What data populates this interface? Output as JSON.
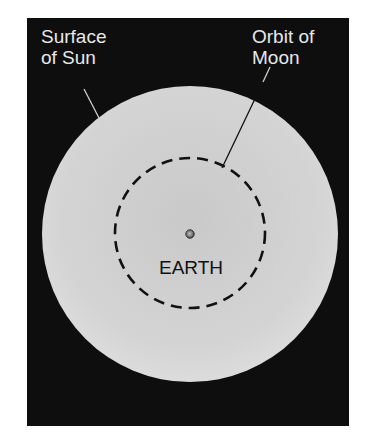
{
  "diagram": {
    "background_color": "#0e0e0e",
    "sun": {
      "label_line1": "Surface",
      "label_line2": "of Sun",
      "color": "#d2d2d2"
    },
    "orbit": {
      "label_line1": "Orbit of",
      "label_line2": "Moon",
      "style": "dashed"
    },
    "earth": {
      "label": "EARTH"
    }
  }
}
